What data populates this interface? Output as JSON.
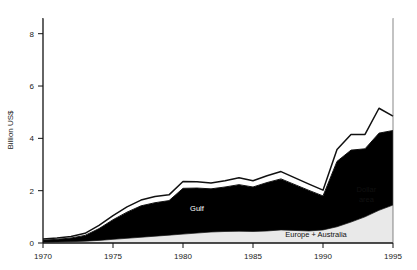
{
  "chart_data": {
    "type": "area",
    "stacked": true,
    "title": "",
    "subtitle": "",
    "xlabel": "",
    "ylabel": "Billion US$",
    "xlim": [
      1970,
      1995
    ],
    "ylim": [
      0,
      8.6
    ],
    "grid": false,
    "legend_position": "inline-annotations",
    "x": [
      1970,
      1971,
      1972,
      1973,
      1974,
      1975,
      1976,
      1977,
      1978,
      1979,
      1980,
      1981,
      1982,
      1983,
      1984,
      1985,
      1986,
      1987,
      1988,
      1989,
      1990,
      1991,
      1992,
      1993,
      1994,
      1995
    ],
    "y_ticks": [
      0,
      2,
      4,
      6,
      8
    ],
    "x_ticks": [
      1970,
      1975,
      1980,
      1985,
      1990,
      1995
    ],
    "series": [
      {
        "name": "Europe + Australia",
        "fill": "#e9e9e9",
        "values": [
          0.03,
          0.04,
          0.05,
          0.07,
          0.1,
          0.14,
          0.18,
          0.22,
          0.26,
          0.3,
          0.34,
          0.38,
          0.42,
          0.44,
          0.45,
          0.44,
          0.46,
          0.5,
          0.48,
          0.46,
          0.5,
          0.62,
          0.8,
          1.0,
          1.25,
          1.45
        ]
      },
      {
        "name": "Gulf",
        "fill": "#000000",
        "values": [
          0.08,
          0.1,
          0.14,
          0.22,
          0.45,
          0.75,
          1.0,
          1.2,
          1.28,
          1.32,
          1.75,
          1.72,
          1.65,
          1.7,
          1.78,
          1.7,
          1.85,
          1.95,
          1.75,
          1.55,
          1.3,
          2.5,
          2.75,
          2.6,
          2.95,
          2.85
        ]
      },
      {
        "name": "Other",
        "fill": "#ffffff",
        "values": [
          0.04,
          0.05,
          0.06,
          0.08,
          0.12,
          0.16,
          0.2,
          0.22,
          0.24,
          0.22,
          0.26,
          0.24,
          0.22,
          0.24,
          0.26,
          0.24,
          0.26,
          0.28,
          0.26,
          0.24,
          0.22,
          0.45,
          0.6,
          0.55,
          0.95,
          0.55
        ]
      }
    ],
    "annotations": [
      {
        "label": "Gulf",
        "x": 1981.0,
        "y": 1.22,
        "color": "#ffffff"
      },
      {
        "label": "Europe + Australia",
        "x": 1989.5,
        "y": 0.22,
        "color": "#111111"
      },
      {
        "label": "Dollar",
        "x": 1993.1,
        "y": 1.95,
        "color": "#111111"
      },
      {
        "label": "area",
        "x": 1993.1,
        "y": 1.55,
        "color": "#111111"
      }
    ]
  }
}
